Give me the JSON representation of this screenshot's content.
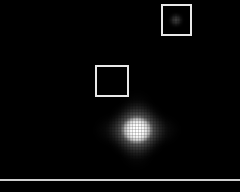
{
  "view": {
    "name": "astronomical-image-viewer",
    "width": 240,
    "height": 192,
    "background_color": "#000000",
    "alt": "Dark sky field with bright diffuse point source and two square aperture markers"
  },
  "colors": {
    "background": "#000000",
    "marker_stroke": "#e8e8e8",
    "scan_line": "#cfcfcf",
    "source_core": "#ffffff"
  },
  "markers": [
    {
      "id": "aperture-box-upper",
      "label": "",
      "x": 161,
      "y": 4,
      "width": 31,
      "height": 32,
      "stroke": "#e8e8e8",
      "stroke_width": 2,
      "contains_source": true
    },
    {
      "id": "aperture-box-lower",
      "label": "",
      "x": 95,
      "y": 65,
      "width": 34,
      "height": 32,
      "stroke": "#e8e8e8",
      "stroke_width": 2,
      "contains_source": false
    }
  ],
  "sources": [
    {
      "id": "primary-source",
      "center_x": 137,
      "center_y": 130,
      "peak_brightness": 255,
      "halo_radius": 40,
      "core_radius": 13,
      "shape": "diffuse-diamond"
    },
    {
      "id": "faint-source",
      "center_x": 176,
      "center_y": 20,
      "peak_brightness": 60,
      "halo_radius": 6,
      "core_radius": 3,
      "shape": "point"
    }
  ],
  "scan_line": {
    "id": "bottom-scan-line",
    "y": 179,
    "thickness": 2,
    "color": "#cfcfcf"
  }
}
